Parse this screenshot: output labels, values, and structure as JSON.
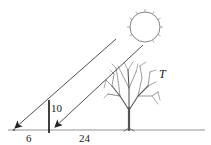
{
  "diagram": {
    "labels": {
      "stick_height": "10",
      "shadow_stick": "6",
      "distance_stick_tree": "24",
      "tree": "T"
    },
    "elements": [
      "sun",
      "sun-ray-1",
      "sun-ray-2",
      "stick",
      "tree",
      "ground-line"
    ],
    "colors": {
      "line": "#222222",
      "sun": "#555555",
      "tree": "#444444"
    }
  }
}
